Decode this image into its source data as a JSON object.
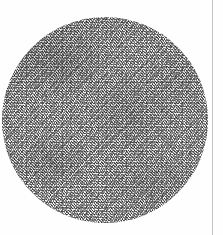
{
  "image": {
    "kind": "scanned-document-photograph",
    "subject": "circular grainy specimen disk",
    "caption_text": "",
    "background_color": "#fefefe",
    "page": {
      "width": 223,
      "height": 235
    }
  },
  "margin_rule": {
    "name": "vertical-ruled-line",
    "x": 212,
    "width": 1,
    "color": "#b9b9b9",
    "orientation": "vertical",
    "full_height": true
  },
  "disk": {
    "name": "grain-disk",
    "center_x": 105,
    "center_y": 120,
    "radius": 103,
    "left": 2,
    "top": 17,
    "diameter": 206,
    "base_color": "#f2f2f2",
    "texture": "random fine speckle / halftone grain",
    "rim_description": "denser darker speckle around circumference, heaviest on upper-left arc",
    "mottle_description": "faint mid-gray blotches across the interior"
  },
  "specks": [
    {
      "x": 92,
      "y": 129,
      "size": 1.6
    },
    {
      "x": 63,
      "y": 170,
      "size": 1.4
    },
    {
      "x": 26,
      "y": 166,
      "size": 1.5
    },
    {
      "x": 190,
      "y": 153,
      "size": 1.3
    },
    {
      "x": 152,
      "y": 196,
      "size": 1.4
    },
    {
      "x": 46,
      "y": 96,
      "size": 1.2
    },
    {
      "x": 176,
      "y": 78,
      "size": 1.2
    },
    {
      "x": 118,
      "y": 58,
      "size": 1.1
    }
  ]
}
